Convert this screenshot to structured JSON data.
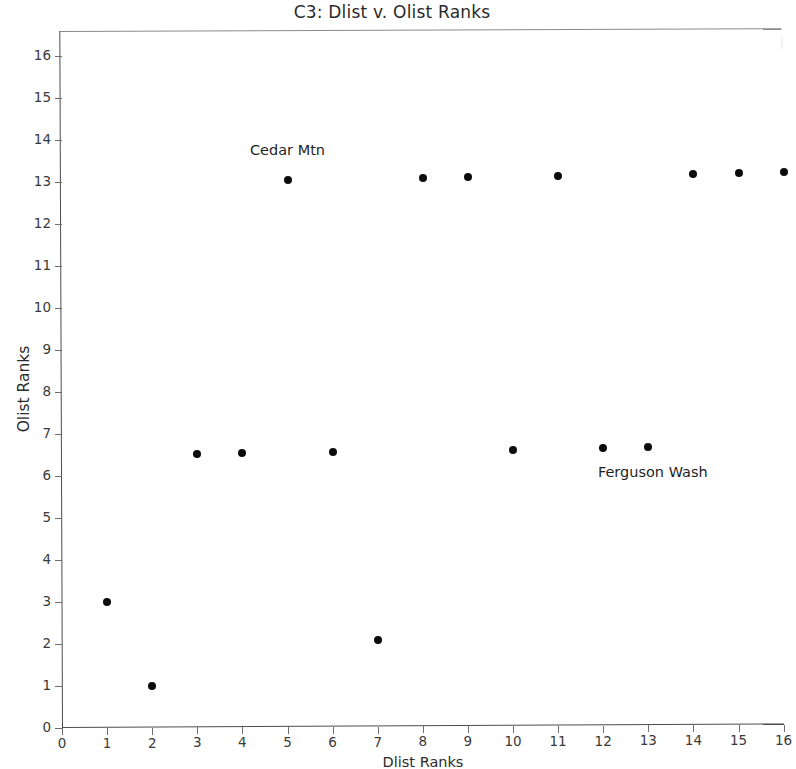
{
  "chart_data": {
    "type": "scatter",
    "title": "C3: Dlist v. Olist Ranks",
    "xlabel": "Dlist Ranks",
    "ylabel": "Olist Ranks",
    "xlim": [
      0,
      16.45
    ],
    "ylim": [
      0,
      16.6
    ],
    "xticks": [
      0,
      1,
      2,
      3,
      4,
      5,
      6,
      7,
      8,
      9,
      10,
      11,
      12,
      13,
      14,
      15,
      16
    ],
    "yticks": [
      0,
      1,
      2,
      3,
      4,
      5,
      6,
      7,
      8,
      9,
      10,
      11,
      12,
      13,
      14,
      15,
      16
    ],
    "xtick_labels": [
      "0",
      "1",
      "2",
      "3",
      "4",
      "5",
      "6",
      "7",
      "8",
      "9",
      "10",
      "11",
      "12",
      "13",
      "14",
      "15",
      "16"
    ],
    "ytick_labels": [
      "0",
      "1",
      "2",
      "3",
      "4",
      "5",
      "6",
      "7",
      "8",
      "9",
      "10",
      "11",
      "12",
      "13",
      "14",
      "15",
      "16"
    ],
    "grid": false,
    "legend": false,
    "marker_color": "#0b0b0b",
    "marker_size": 8,
    "series": [
      {
        "name": "Dlist v. Olist Ranks",
        "x": [
          1,
          2,
          3,
          4,
          5,
          6,
          7,
          8,
          9,
          10,
          11,
          12,
          13,
          14,
          15,
          16
        ],
        "y": [
          3.0,
          1.0,
          6.52,
          6.53,
          13.02,
          6.55,
          2.05,
          13.06,
          13.07,
          6.58,
          13.1,
          6.6,
          6.62,
          13.13,
          13.15,
          13.17
        ]
      }
    ],
    "points": [
      {
        "x": 1,
        "y": 3.0
      },
      {
        "x": 2,
        "y": 1.0
      },
      {
        "x": 3,
        "y": 6.52
      },
      {
        "x": 4,
        "y": 6.53
      },
      {
        "x": 5,
        "y": 13.02
      },
      {
        "x": 6,
        "y": 6.55
      },
      {
        "x": 7,
        "y": 2.05
      },
      {
        "x": 8,
        "y": 13.06
      },
      {
        "x": 9,
        "y": 13.07
      },
      {
        "x": 10,
        "y": 6.58
      },
      {
        "x": 11,
        "y": 13.1
      },
      {
        "x": 12,
        "y": 6.6
      },
      {
        "x": 13,
        "y": 6.62
      },
      {
        "x": 14,
        "y": 13.13
      },
      {
        "x": 15,
        "y": 13.15
      },
      {
        "x": 16,
        "y": 13.17
      }
    ],
    "annotations": [
      {
        "text": "Cedar Mtn",
        "x": 5.0,
        "y": 13.72,
        "align": "center"
      },
      {
        "text": "Ferguson Wash",
        "x": 13.1,
        "y": 6.02,
        "align": "center"
      }
    ]
  }
}
